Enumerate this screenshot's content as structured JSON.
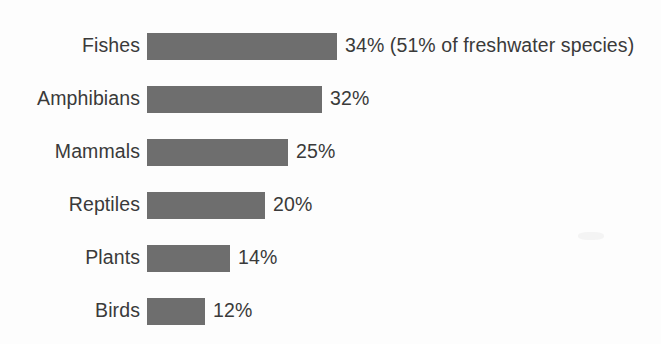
{
  "chart_data": {
    "type": "bar",
    "orientation": "horizontal",
    "title": "",
    "subtitle": "",
    "xlabel": "",
    "ylabel": "",
    "grid": false,
    "legend": null,
    "axis_visible": false,
    "value_unit": "%",
    "xlim": [
      0,
      34
    ],
    "categories": [
      "Fishes",
      "Amphibians",
      "Mammals",
      "Reptiles",
      "Plants",
      "Birds"
    ],
    "values": [
      34,
      32,
      25,
      20,
      14,
      12
    ],
    "value_labels": [
      "34%",
      "32%",
      "25%",
      "20%",
      "14%",
      "12%"
    ],
    "annotations": [
      {
        "category": "Fishes",
        "text": "(51% of freshwater species)",
        "value": 51
      }
    ],
    "bar_color": "#6e6e6e",
    "text_color": "#3a3a3a",
    "background_color": "#fdfdfd"
  },
  "rows": [
    {
      "category": "Fishes",
      "value_label": "34%",
      "annotation": " (51% of freshwater species)",
      "bar_px": 190,
      "top": 28
    },
    {
      "category": "Amphibians",
      "value_label": "32%",
      "annotation": "",
      "bar_px": 175,
      "top": 81
    },
    {
      "category": "Mammals",
      "value_label": "25%",
      "annotation": "",
      "bar_px": 141,
      "top": 134
    },
    {
      "category": "Reptiles",
      "value_label": "20%",
      "annotation": "",
      "bar_px": 118,
      "top": 187
    },
    {
      "category": "Plants",
      "value_label": "14%",
      "annotation": "",
      "bar_px": 83,
      "top": 240
    },
    {
      "category": "Birds",
      "value_label": "12%",
      "annotation": "",
      "bar_px": 58,
      "top": 293
    }
  ]
}
